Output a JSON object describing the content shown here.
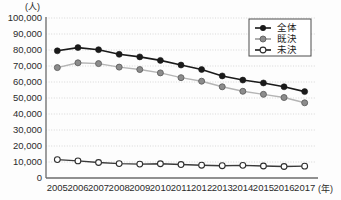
{
  "chart_data": {
    "type": "line",
    "title": "",
    "subtitle": "",
    "xlabel": "(年)",
    "ylabel": "(人)",
    "x": [
      2005,
      2006,
      2007,
      2008,
      2009,
      2010,
      2011,
      2012,
      2013,
      2014,
      2015,
      2016,
      2017
    ],
    "categories": [
      "2005",
      "2006",
      "2007",
      "2008",
      "2009",
      "2010",
      "2011",
      "2012",
      "2013",
      "2014",
      "2015",
      "2016",
      "2017"
    ],
    "ylim": [
      0,
      100000
    ],
    "yticks": [
      0,
      10000,
      20000,
      30000,
      40000,
      50000,
      60000,
      70000,
      80000,
      90000,
      100000
    ],
    "ytick_labels": [
      "0",
      "10,000",
      "20,000",
      "30,000",
      "40,000",
      "50,000",
      "60,000",
      "70,000",
      "80,000",
      "90,000",
      "100,000"
    ],
    "grid": true,
    "grid_axis": "y",
    "legend_position": "top-right",
    "series": [
      {
        "name": "全体",
        "marker": "filled-circle",
        "color": "#1a1a1a",
        "marker_fill": "#1a1a1a",
        "values": [
          79500,
          81500,
          80200,
          77300,
          75700,
          73500,
          70600,
          67800,
          63800,
          61200,
          59400,
          57000,
          54000
        ]
      },
      {
        "name": "既決",
        "marker": "gray-circle",
        "color": "#b4b4b4",
        "marker_fill": "#8c8c8c",
        "values": [
          69000,
          72000,
          71500,
          69300,
          67800,
          65700,
          62700,
          60500,
          57000,
          54200,
          52300,
          50300,
          47000
        ]
      },
      {
        "name": "未決",
        "marker": "open-circle",
        "color": "#3a3a3a",
        "marker_fill": "#ffffff",
        "values": [
          11500,
          10700,
          9700,
          9000,
          8700,
          8900,
          8400,
          8000,
          7700,
          7900,
          7500,
          7200,
          7400
        ]
      }
    ]
  },
  "legend": {
    "entries": [
      {
        "label": "全体"
      },
      {
        "label": "既決"
      },
      {
        "label": "未決"
      }
    ]
  },
  "colors": {
    "axis": "#6b6b6b",
    "grid": "#c9c9c9",
    "text": "#2b2b2b",
    "background": "#fdfdfd",
    "legend_border": "#4d4d4d"
  }
}
